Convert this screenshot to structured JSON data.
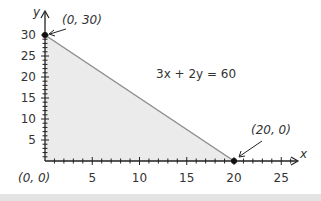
{
  "chart_data": {
    "type": "area",
    "title": "",
    "equation": "3x + 2y = 60",
    "xlabel": "x",
    "ylabel": "y",
    "xlim": [
      0,
      25
    ],
    "ylim": [
      0,
      30
    ],
    "x_ticks": [
      "5",
      "10",
      "15",
      "20",
      "25"
    ],
    "y_ticks": [
      "5",
      "10",
      "15",
      "20",
      "25",
      "30"
    ],
    "line": {
      "x": [
        0,
        20
      ],
      "y": [
        30,
        0
      ]
    },
    "points": [
      {
        "label": "(0, 30)",
        "x": 0,
        "y": 30
      },
      {
        "label": "(20, 0)",
        "x": 20,
        "y": 0
      },
      {
        "label": "(0, 0)",
        "x": 0,
        "y": 0
      }
    ],
    "shaded_region": "triangle with vertices (0,0), (0,30), (20,0)",
    "grid": false,
    "colors": {
      "fill": "#ebebeb",
      "line": "#8a8a8a",
      "axis": "#222222"
    }
  },
  "labels": {
    "equation": "3x + 2y = 60",
    "point_top": "(0, 30)",
    "point_right": "(20, 0)",
    "origin": "(0, 0)",
    "x_axis": "x",
    "y_axis": "y",
    "x_ticks": [
      "5",
      "10",
      "15",
      "20",
      "25"
    ],
    "y_ticks": [
      "5",
      "10",
      "15",
      "20",
      "25",
      "30"
    ]
  }
}
